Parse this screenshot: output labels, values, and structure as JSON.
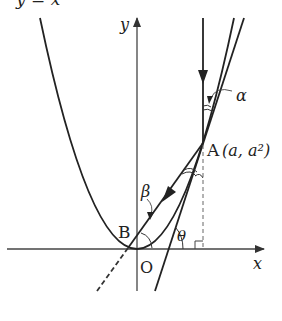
{
  "figure": {
    "curve_label": "y = x²",
    "axis_y_label": "y",
    "axis_x_label": "x",
    "origin_label": "O",
    "point_a_label": "A",
    "point_a_coords": "(a, a²)",
    "point_b_label": "B",
    "angle_alpha": "α",
    "angle_beta": "β",
    "angle_theta": "θ"
  },
  "colors": {
    "stroke": "#222222",
    "axis": "#444444",
    "dashed": "#555555",
    "background": "#ffffff"
  }
}
